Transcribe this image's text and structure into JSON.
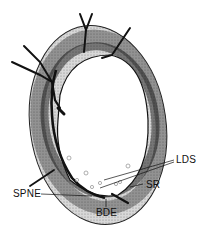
{
  "diagram": {
    "type": "anatomical cross-section",
    "labels": {
      "lds": "LDS",
      "sr": "SR",
      "spne": "SPNE",
      "bde": "BDE"
    },
    "colors": {
      "background": "#ffffff",
      "ink": "#111111",
      "stipple": "#555555"
    }
  }
}
